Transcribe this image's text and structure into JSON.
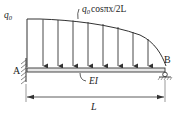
{
  "diagram": {
    "load_label_base": "q",
    "load_label_sub": "0",
    "load_label_expr": "cosπx/2L",
    "left_load_label_base": "q",
    "left_load_label_sub": "0",
    "support_a_label": "A",
    "support_b_label": "B",
    "stiffness_label": "EI",
    "span_label": "L",
    "support_a_type": "fixed",
    "support_b_type": "pin",
    "arrow_count": 9,
    "colors": {
      "line": "#333333",
      "beam_fill": "#e6e6e6"
    }
  }
}
